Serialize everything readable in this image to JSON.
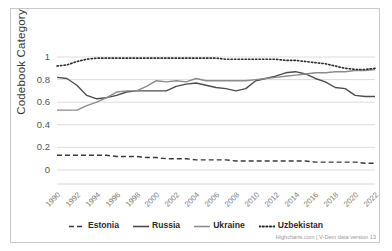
{
  "axes": {
    "ylabel": "Codebook Category",
    "yticks": [
      "1",
      "0.8",
      "0.6",
      "0.4",
      "0.2",
      "0"
    ],
    "xticks": [
      "1990",
      "1992",
      "1994",
      "1996",
      "1998",
      "2000",
      "2002",
      "2004",
      "2006",
      "2008",
      "2010",
      "2012",
      "2014",
      "2016",
      "2018",
      "2020",
      "2022"
    ]
  },
  "legend": {
    "items": [
      {
        "label": "Estonia",
        "style": "dashed",
        "color": "#3a3a3a"
      },
      {
        "label": "Russia",
        "style": "solid",
        "color": "#4d4d4d"
      },
      {
        "label": "Ukraine",
        "style": "solid",
        "color": "#8c8c8c"
      },
      {
        "label": "Uzbekistan",
        "style": "dotted",
        "color": "#2e2e2e"
      }
    ]
  },
  "credit": "Highcharts.com | V-Dem data version 13",
  "chart_data": {
    "type": "line",
    "title": "",
    "subtitle": "",
    "xlabel": "",
    "ylabel": "Codebook Category",
    "xlim": [
      1990,
      2022
    ],
    "ylim": [
      0,
      1
    ],
    "grid": true,
    "legend_position": "bottom",
    "x": [
      1990,
      1991,
      1992,
      1993,
      1994,
      1995,
      1996,
      1997,
      1998,
      1999,
      2000,
      2001,
      2002,
      2003,
      2004,
      2005,
      2006,
      2007,
      2008,
      2009,
      2010,
      2011,
      2012,
      2013,
      2014,
      2015,
      2016,
      2017,
      2018,
      2019,
      2020,
      2021,
      2022
    ],
    "series": [
      {
        "name": "Estonia",
        "style": "dashed",
        "color": "#3a3a3a",
        "values": [
          0.13,
          0.13,
          0.13,
          0.13,
          0.13,
          0.13,
          0.12,
          0.12,
          0.12,
          0.11,
          0.11,
          0.1,
          0.1,
          0.1,
          0.09,
          0.09,
          0.09,
          0.09,
          0.08,
          0.08,
          0.08,
          0.08,
          0.08,
          0.08,
          0.08,
          0.08,
          0.07,
          0.07,
          0.07,
          0.07,
          0.07,
          0.06,
          0.06
        ]
      },
      {
        "name": "Russia",
        "style": "solid",
        "color": "#4d4d4d",
        "values": [
          0.82,
          0.81,
          0.75,
          0.66,
          0.63,
          0.64,
          0.66,
          0.69,
          0.7,
          0.7,
          0.7,
          0.7,
          0.74,
          0.76,
          0.77,
          0.75,
          0.73,
          0.72,
          0.7,
          0.72,
          0.79,
          0.81,
          0.83,
          0.86,
          0.87,
          0.85,
          0.81,
          0.78,
          0.73,
          0.72,
          0.66,
          0.65,
          0.65
        ]
      },
      {
        "name": "Ukraine",
        "style": "solid",
        "color": "#8c8c8c",
        "values": [
          0.53,
          0.53,
          0.53,
          0.57,
          0.6,
          0.64,
          0.69,
          0.7,
          0.7,
          0.74,
          0.79,
          0.78,
          0.79,
          0.78,
          0.81,
          0.79,
          0.79,
          0.79,
          0.79,
          0.79,
          0.8,
          0.81,
          0.82,
          0.83,
          0.84,
          0.85,
          0.86,
          0.86,
          0.87,
          0.87,
          0.88,
          0.88,
          0.89
        ]
      },
      {
        "name": "Uzbekistan",
        "style": "dotted",
        "color": "#2e2e2e",
        "values": [
          0.92,
          0.93,
          0.96,
          0.98,
          0.99,
          0.99,
          0.99,
          0.99,
          0.99,
          0.99,
          0.99,
          0.99,
          0.99,
          0.99,
          0.99,
          0.99,
          0.99,
          0.98,
          0.98,
          0.98,
          0.98,
          0.98,
          0.98,
          0.97,
          0.97,
          0.96,
          0.95,
          0.94,
          0.92,
          0.9,
          0.89,
          0.89,
          0.9
        ]
      }
    ]
  }
}
